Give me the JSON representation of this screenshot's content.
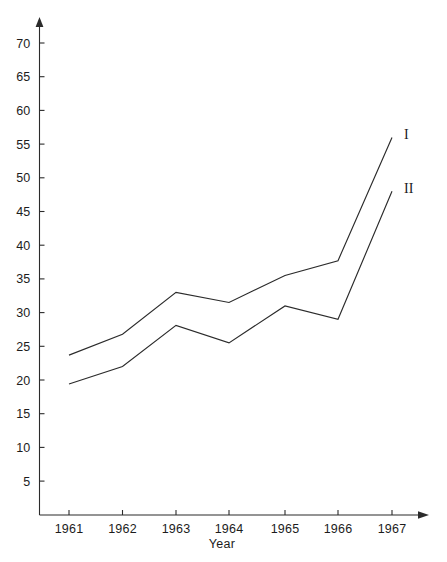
{
  "chart_data": {
    "type": "line",
    "title": "",
    "subtitle": "",
    "xlabel": "Year",
    "ylabel": "",
    "categories": [
      "1961",
      "1962",
      "1963",
      "1964",
      "1965",
      "1966",
      "1967"
    ],
    "x": [
      1961,
      1962,
      1963,
      1964,
      1965,
      1966,
      1967
    ],
    "series": [
      {
        "name": "I",
        "values": [
          23.7,
          26.8,
          33.0,
          31.5,
          35.5,
          37.7,
          56.0
        ]
      },
      {
        "name": "II",
        "values": [
          19.4,
          22.0,
          28.1,
          25.5,
          31.0,
          29.0,
          48.0
        ]
      }
    ],
    "y_ticks": [
      5,
      10,
      15,
      20,
      25,
      30,
      35,
      40,
      45,
      50,
      55,
      60,
      65,
      70
    ],
    "y_tick_labels": [
      "5",
      "10",
      "15",
      "20",
      "25",
      "30",
      "35",
      "40",
      "45",
      "50",
      "55",
      "60",
      "65",
      "70"
    ],
    "ylim": [
      0,
      72
    ],
    "xlim": [
      1960.6,
      1967.6
    ],
    "grid": false,
    "legend_position": "inline-right-end",
    "annotations": [
      {
        "text": "I",
        "series": "I",
        "at_x": 1967,
        "at_y": 56.0
      },
      {
        "text": "II",
        "series": "II",
        "at_x": 1967,
        "at_y": 48.0
      }
    ],
    "axis_style": {
      "y_axis_arrow": true,
      "x_axis_arrow": true,
      "line_color": "#2b2b2b",
      "background": "#ffffff"
    }
  },
  "axes": {
    "y_axis_name": "value-axis",
    "x_axis_name": "year-axis",
    "x_title": "Year"
  }
}
